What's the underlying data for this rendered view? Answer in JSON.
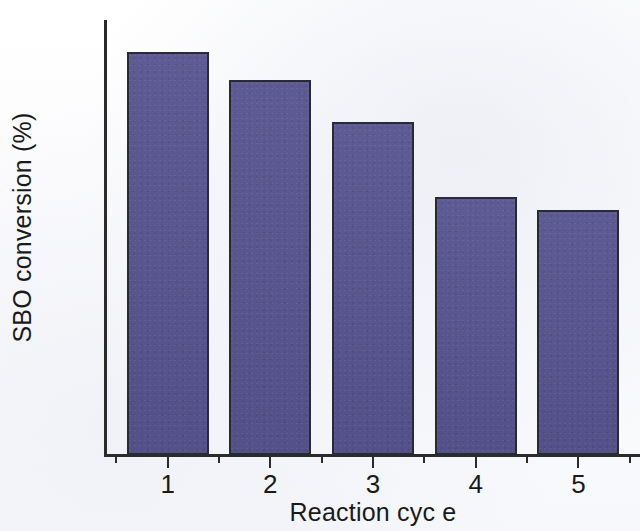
{
  "figure": {
    "background_color": "#fdfdfd",
    "axis_color": "#2b2b2b",
    "bar_fill_color": "#585490",
    "bar_border_color": "#2a2a33"
  },
  "chart_data": {
    "type": "bar",
    "title": "",
    "xlabel": "Reaction cyc e",
    "ylabel": "SBO conversion (%)",
    "categories": [
      "1",
      "2",
      "3",
      "4",
      "5"
    ],
    "values": [
      93,
      86.5,
      77,
      59.5,
      56.5
    ],
    "series": [
      {
        "name": "SBO conversion",
        "values": [
          93,
          86.5,
          77,
          59.5,
          56.5
        ],
        "color": "#585490"
      }
    ],
    "ylim": [
      0,
      100
    ],
    "xlim": [
      0.4,
      5.6
    ],
    "y_major_ticks": [
      0,
      20,
      40,
      60,
      80,
      100
    ],
    "y_minor_ticks": [
      10,
      30,
      50,
      70,
      90
    ],
    "y_tick_labels": [
      "0",
      "20",
      "40",
      "60",
      "80",
      "100"
    ],
    "x_major_ticks": [
      1,
      2,
      3,
      4,
      5
    ],
    "x_tick_labels": [
      "1",
      "2",
      "3",
      "4",
      "5"
    ],
    "grid": false,
    "legend": false,
    "legend_position": "none",
    "annotations": []
  }
}
